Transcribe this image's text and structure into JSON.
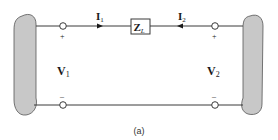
{
  "diagram": {
    "type": "two-port network with series impedance",
    "caption": "(a)",
    "impedance": {
      "symbol": "Z",
      "subscript": "L"
    },
    "currents": [
      {
        "symbol": "I",
        "subscript": "1",
        "direction": "right"
      },
      {
        "symbol": "I",
        "subscript": "2",
        "direction": "left"
      }
    ],
    "voltages": [
      {
        "symbol": "V",
        "subscript": "1"
      },
      {
        "symbol": "V",
        "subscript": "2"
      }
    ],
    "polarity": {
      "plus": "+",
      "minus": "–"
    },
    "colors": {
      "wire": "#3a3a3a",
      "blob_fill": "#c8c8c8",
      "blob_stroke": "#555555",
      "terminal_fill": "#ffffff"
    }
  }
}
